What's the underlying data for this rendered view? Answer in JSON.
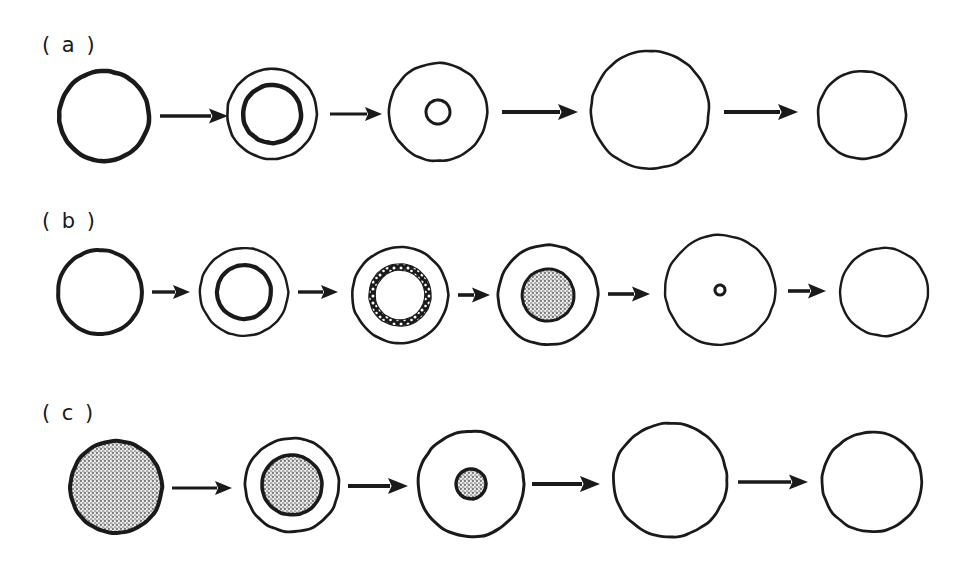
{
  "figure": {
    "background_color": "#ffffff",
    "stroke_color": "#1a1a1a",
    "stipple_color": "#8f8f8f",
    "width": 972,
    "height": 569
  },
  "rows": [
    {
      "id": "row-a",
      "label": "( a )",
      "label_x": 42,
      "label_y": 52,
      "center_y": 116,
      "stage_count": 5,
      "stages": [
        {
          "name": "stage-a-1",
          "cx": 104,
          "cy": 116,
          "outer_r": 45,
          "outer_stroke": 4.5,
          "outer_fill": "none",
          "inner": null,
          "core": null,
          "speckled_ring": false
        },
        {
          "name": "stage-a-2",
          "cx": 272,
          "cy": 114,
          "outer_r": 45,
          "outer_stroke": 2.6,
          "outer_fill": "none",
          "inner": {
            "r": 29,
            "stroke": 4.5,
            "fill": "none"
          },
          "core": null,
          "speckled_ring": false
        },
        {
          "name": "stage-a-3",
          "cx": 438,
          "cy": 112,
          "outer_r": 49,
          "outer_stroke": 2.6,
          "outer_fill": "none",
          "inner": {
            "r": 12,
            "stroke": 3.0,
            "fill": "none"
          },
          "core": null,
          "speckled_ring": false
        },
        {
          "name": "stage-a-4",
          "cx": 650,
          "cy": 110,
          "outer_r": 59,
          "outer_stroke": 2.6,
          "outer_fill": "none",
          "inner": null,
          "core": null,
          "speckled_ring": false
        },
        {
          "name": "stage-a-5",
          "cx": 862,
          "cy": 115,
          "outer_r": 44,
          "outer_stroke": 2.6,
          "outer_fill": "none",
          "inner": null,
          "core": null,
          "speckled_ring": false
        }
      ],
      "arrows": [
        {
          "name": "arrow-a-1",
          "x1": 160,
          "x2": 228,
          "y": 116,
          "shaft": 3.4,
          "head_w": 19,
          "head_h": 15
        },
        {
          "name": "arrow-a-2",
          "x1": 330,
          "x2": 382,
          "y": 114,
          "shaft": 3.0,
          "head_w": 17,
          "head_h": 14
        },
        {
          "name": "arrow-a-3",
          "x1": 502,
          "x2": 578,
          "y": 112,
          "shaft": 4.0,
          "head_w": 20,
          "head_h": 16
        },
        {
          "name": "arrow-a-4",
          "x1": 724,
          "x2": 798,
          "y": 112,
          "shaft": 4.0,
          "head_w": 20,
          "head_h": 16
        }
      ]
    },
    {
      "id": "row-b",
      "label": "( b )",
      "label_x": 42,
      "label_y": 228,
      "center_y": 295,
      "stage_count": 6,
      "stages": [
        {
          "name": "stage-b-1",
          "cx": 100,
          "cy": 292,
          "outer_r": 42,
          "outer_stroke": 4.0,
          "outer_fill": "none",
          "inner": null,
          "core": null,
          "speckled_ring": false
        },
        {
          "name": "stage-b-2",
          "cx": 244,
          "cy": 292,
          "outer_r": 44,
          "outer_stroke": 2.4,
          "outer_fill": "none",
          "inner": {
            "r": 27,
            "stroke": 4.2,
            "fill": "none"
          },
          "core": null,
          "speckled_ring": false
        },
        {
          "name": "stage-b-3",
          "cx": 400,
          "cy": 295,
          "outer_r": 48,
          "outer_stroke": 2.6,
          "outer_fill": "none",
          "inner": {
            "r": 28,
            "stroke": 6.5,
            "fill": "none"
          },
          "core": null,
          "speckled_ring": true
        },
        {
          "name": "stage-b-4",
          "cx": 548,
          "cy": 295,
          "outer_r": 50,
          "outer_stroke": 2.8,
          "outer_fill": "none",
          "inner": {
            "r": 26,
            "stroke": 3.0,
            "fill": "stipple"
          },
          "core": null,
          "speckled_ring": false
        },
        {
          "name": "stage-b-5",
          "cx": 720,
          "cy": 290,
          "outer_r": 55,
          "outer_stroke": 2.4,
          "outer_fill": "none",
          "inner": null,
          "core": {
            "r": 5.0,
            "stroke": 3.0,
            "fill": "none"
          },
          "speckled_ring": false
        },
        {
          "name": "stage-b-6",
          "cx": 884,
          "cy": 292,
          "outer_r": 44,
          "outer_stroke": 2.4,
          "outer_fill": "none",
          "inner": null,
          "core": null,
          "speckled_ring": false
        }
      ],
      "arrows": [
        {
          "name": "arrow-b-1",
          "x1": 152,
          "x2": 190,
          "y": 292,
          "shaft": 3.4,
          "head_w": 17,
          "head_h": 14
        },
        {
          "name": "arrow-b-2",
          "x1": 298,
          "x2": 338,
          "y": 292,
          "shaft": 3.4,
          "head_w": 17,
          "head_h": 14
        },
        {
          "name": "arrow-b-3",
          "x1": 458,
          "x2": 490,
          "y": 295,
          "shaft": 3.6,
          "head_w": 18,
          "head_h": 15
        },
        {
          "name": "arrow-b-4",
          "x1": 608,
          "x2": 650,
          "y": 294,
          "shaft": 3.6,
          "head_w": 18,
          "head_h": 15
        },
        {
          "name": "arrow-b-5",
          "x1": 788,
          "x2": 826,
          "y": 291,
          "shaft": 3.6,
          "head_w": 18,
          "head_h": 15
        }
      ]
    },
    {
      "id": "row-c",
      "label": "( c )",
      "label_x": 42,
      "label_y": 420,
      "center_y": 487,
      "stage_count": 5,
      "stages": [
        {
          "name": "stage-c-1",
          "cx": 116,
          "cy": 487,
          "outer_r": 46,
          "outer_stroke": 4.0,
          "outer_fill": "stipple",
          "inner": null,
          "core": null,
          "speckled_ring": false
        },
        {
          "name": "stage-c-2",
          "cx": 292,
          "cy": 485,
          "outer_r": 47,
          "outer_stroke": 2.8,
          "outer_fill": "none",
          "inner": {
            "r": 30,
            "stroke": 3.6,
            "fill": "stipple"
          },
          "core": null,
          "speckled_ring": false
        },
        {
          "name": "stage-c-3",
          "cx": 471,
          "cy": 484,
          "outer_r": 53,
          "outer_stroke": 3.0,
          "outer_fill": "none",
          "inner": {
            "r": 15,
            "stroke": 3.4,
            "fill": "stipple"
          },
          "core": null,
          "speckled_ring": false
        },
        {
          "name": "stage-c-4",
          "cx": 670,
          "cy": 480,
          "outer_r": 57,
          "outer_stroke": 2.8,
          "outer_fill": "none",
          "inner": null,
          "core": null,
          "speckled_ring": false
        },
        {
          "name": "stage-c-5",
          "cx": 872,
          "cy": 482,
          "outer_r": 50,
          "outer_stroke": 2.8,
          "outer_fill": "none",
          "inner": null,
          "core": null,
          "speckled_ring": false
        }
      ],
      "arrows": [
        {
          "name": "arrow-c-1",
          "x1": 172,
          "x2": 232,
          "y": 488,
          "shaft": 2.8,
          "head_w": 17,
          "head_h": 14
        },
        {
          "name": "arrow-c-2",
          "x1": 348,
          "x2": 408,
          "y": 486,
          "shaft": 4.0,
          "head_w": 20,
          "head_h": 16
        },
        {
          "name": "arrow-c-3",
          "x1": 532,
          "x2": 600,
          "y": 484,
          "shaft": 4.0,
          "head_w": 20,
          "head_h": 16
        },
        {
          "name": "arrow-c-4",
          "x1": 738,
          "x2": 808,
          "y": 482,
          "shaft": 3.4,
          "head_w": 19,
          "head_h": 15
        }
      ]
    }
  ]
}
